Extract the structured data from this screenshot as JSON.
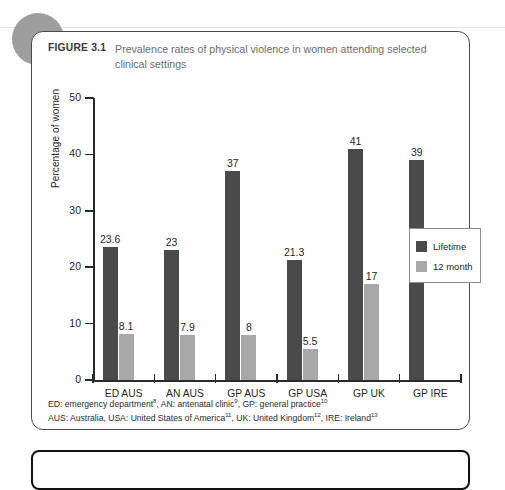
{
  "figure": {
    "label": "FIGURE 3.1",
    "title": "Prevalence rates of physical violence in women attending selected clinical settings"
  },
  "footnotes": {
    "line1_parts": {
      "a": "ED: emergency department",
      "a_sup": "8",
      "b": ", AN: antenatal clinic",
      "b_sup": "9",
      "c": ", GP: general practice",
      "c_sup": "10"
    },
    "line2_parts": {
      "a": "AUS: Australia, USA: United States of America",
      "a_sup": "11",
      "b": ", UK: United Kingdom",
      "b_sup": "12",
      "c": ", IRE: Ireland",
      "c_sup": "13"
    }
  },
  "legend": {
    "items": [
      {
        "label": "Lifetime",
        "color": "#4a4a4a"
      },
      {
        "label": "12 month",
        "color": "#a8a8a8"
      }
    ]
  },
  "chart_data": {
    "type": "bar",
    "title": "Prevalence rates of physical violence in women attending selected clinical settings",
    "xlabel": "",
    "ylabel": "Percentage of women",
    "ylim": [
      0,
      50
    ],
    "yticks": [
      0,
      10,
      20,
      30,
      40,
      50
    ],
    "grid": false,
    "legend_position": "right-inside",
    "categories": [
      "ED AUS",
      "AN AUS",
      "GP AUS",
      "GP USA",
      "GP UK",
      "GP IRE"
    ],
    "series": [
      {
        "name": "Lifetime",
        "color": "#4a4a4a",
        "values": [
          23.6,
          23,
          37,
          21.3,
          41,
          39
        ],
        "labels": [
          "23.6",
          "23",
          "37",
          "21.3",
          "41",
          "39"
        ]
      },
      {
        "name": "12 month",
        "color": "#a8a8a8",
        "values": [
          8.1,
          7.9,
          8,
          5.5,
          17,
          null
        ],
        "labels": [
          "8.1",
          "7.9",
          "8",
          "5.5",
          "17",
          ""
        ]
      }
    ]
  }
}
